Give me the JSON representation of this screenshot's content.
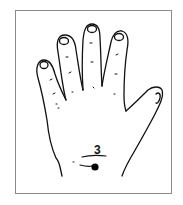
{
  "figure": {
    "point": {
      "label": "3",
      "color": "#000000"
    },
    "colors": {
      "line": "#111111",
      "frame": "#8a8a8a",
      "background": "#ffffff"
    }
  }
}
